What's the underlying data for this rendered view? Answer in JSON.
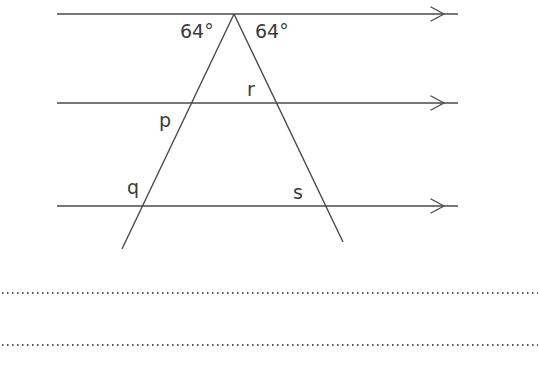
{
  "diagram": {
    "angles": {
      "left_top": "64°",
      "right_top": "64°"
    },
    "labels": {
      "p": "p",
      "q": "q",
      "r": "r",
      "s": "s"
    },
    "parallel_lines": [
      {
        "name": "top",
        "y": 14
      },
      {
        "name": "middle",
        "y": 103
      },
      {
        "name": "bottom",
        "y": 206
      }
    ],
    "answer_lines": 2,
    "colors": {
      "line": "#4a4a4a",
      "text": "#3a3a3a",
      "background": "#ffffff"
    }
  }
}
